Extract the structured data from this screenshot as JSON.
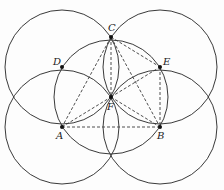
{
  "diagram": {
    "radius": 57,
    "circles": [
      {
        "center": "D",
        "cx": 62,
        "cy": 67
      },
      {
        "center": "E",
        "cx": 160,
        "cy": 67
      },
      {
        "center": "A",
        "cx": 62,
        "cy": 127
      },
      {
        "center": "B",
        "cx": 160,
        "cy": 127
      },
      {
        "center": "F",
        "cx": 111,
        "cy": 97
      }
    ],
    "points": [
      {
        "name": "C",
        "x": 111,
        "y": 37,
        "lx": 108,
        "ly": 31
      },
      {
        "name": "D",
        "x": 62,
        "y": 67,
        "lx": 53,
        "ly": 65
      },
      {
        "name": "E",
        "x": 160,
        "y": 67,
        "lx": 163,
        "ly": 65
      },
      {
        "name": "F",
        "x": 111,
        "y": 97,
        "lx": 107,
        "ly": 110
      },
      {
        "name": "A",
        "x": 62,
        "y": 127,
        "lx": 56,
        "ly": 139
      },
      {
        "name": "B",
        "x": 160,
        "y": 127,
        "lx": 157,
        "ly": 139
      }
    ],
    "segments": [
      [
        "C",
        "A"
      ],
      [
        "C",
        "F"
      ],
      [
        "C",
        "B"
      ],
      [
        "A",
        "B"
      ],
      [
        "A",
        "F"
      ],
      [
        "F",
        "E"
      ],
      [
        "F",
        "B"
      ],
      [
        "E",
        "B"
      ],
      [
        "C",
        "E"
      ]
    ],
    "labels": {
      "C": "C",
      "D": "D",
      "E": "E",
      "F": "F",
      "A": "A",
      "B": "B"
    }
  }
}
